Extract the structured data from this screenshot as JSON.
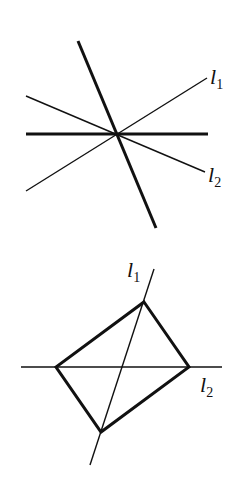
{
  "figures": [
    {
      "name": "top-figure",
      "description": "Four lines through a common point: two thick (horizontal and steep), two thin labeled l1 and l2",
      "labels": {
        "l1": "l",
        "l1_sub": "1",
        "l2": "l",
        "l2_sub": "2"
      }
    },
    {
      "name": "bottom-figure",
      "description": "Quadrilateral with diagonals lying on lines l1 and l2",
      "labels": {
        "l1": "l",
        "l1_sub": "1",
        "l2": "l",
        "l2_sub": "2"
      }
    }
  ],
  "colors": {
    "stroke": "#111111",
    "background": "#ffffff"
  }
}
